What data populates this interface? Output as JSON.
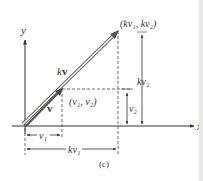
{
  "figure": {
    "caption": "(c)",
    "axes": {
      "x_label": "x",
      "y_label": "y"
    },
    "vectors": [
      {
        "name": "v",
        "label": "v",
        "tip_label": "(v₁, v₂)",
        "color": "#555555"
      },
      {
        "name": "kv",
        "label": "kv",
        "label_k": "k",
        "label_v": "v",
        "tip_label": "(kv₁, kv₂)",
        "color": "#777777"
      }
    ],
    "dimensions": {
      "v1": "v₁",
      "kv1": "kv₁",
      "v2": "v₂",
      "kv2": "kv₂"
    },
    "colors": {
      "axis": "#333333",
      "dashed": "#444444",
      "text": "#333333"
    }
  }
}
